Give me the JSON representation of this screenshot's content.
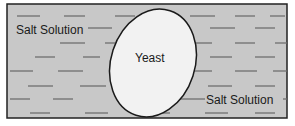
{
  "diagram": {
    "colors": {
      "solution_fill": "#c8c8c8",
      "border": "#222222",
      "dash": "#6e6e6e",
      "cell_fill": "#f2f2f2",
      "cell_stroke": "#1a1a1a"
    },
    "labels": {
      "salt_top": "Salt Solution",
      "yeast": "Yeast",
      "salt_bottom": "Salt Solution"
    }
  }
}
